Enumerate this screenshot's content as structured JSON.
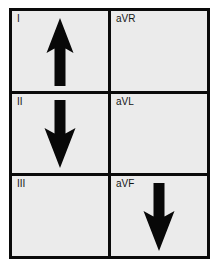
{
  "figure": {
    "name": "ecg-frontal-lead-axis-grid",
    "background_color": "#ffffff",
    "cell_background_color": "#ebebeb",
    "border_color": "#0a0a0a",
    "arrow_color": "#080808",
    "columns": 2,
    "rows": 3
  },
  "cells": [
    {
      "label": "I",
      "arrow": "up",
      "arrow_icon": "arrow-up-icon",
      "row": 1,
      "col": 1
    },
    {
      "label": "aVR",
      "arrow": "none",
      "arrow_icon": "",
      "row": 1,
      "col": 2
    },
    {
      "label": "II",
      "arrow": "down",
      "arrow_icon": "arrow-down-icon",
      "row": 2,
      "col": 1
    },
    {
      "label": "aVL",
      "arrow": "none",
      "arrow_icon": "",
      "row": 2,
      "col": 2
    },
    {
      "label": "III",
      "arrow": "none",
      "arrow_icon": "",
      "row": 3,
      "col": 1
    },
    {
      "label": "aVF",
      "arrow": "down",
      "arrow_icon": "arrow-down-icon",
      "row": 3,
      "col": 2
    }
  ]
}
